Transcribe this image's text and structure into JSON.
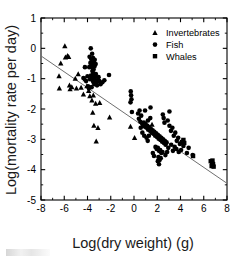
{
  "figure": {
    "background_color": "#ffffff",
    "ink_color": "#000000",
    "line_color": "#6f6f6f"
  },
  "chart_data": {
    "type": "scatter",
    "title": "",
    "xlabel": "Log(dry weight) (g)",
    "ylabel": "Log(mortality rate per day)",
    "xlim": [
      -8,
      8
    ],
    "ylim": [
      -5,
      1
    ],
    "xticks": [
      -8,
      -6,
      -4,
      -2,
      0,
      2,
      4,
      6,
      8
    ],
    "yticks": [
      1,
      0,
      -1,
      -2,
      -3,
      -4,
      -5
    ],
    "xtick_labels": [
      "-8",
      "-6",
      "-4",
      "-2",
      "0",
      "2",
      "4",
      "6",
      "8"
    ],
    "ytick_labels": [
      "1",
      "0",
      "-1",
      "-2",
      "-3",
      "-4",
      "-5"
    ],
    "xtick_minor_step": 1,
    "ytick_minor_step": 0.5,
    "grid": false,
    "tick_direction": "in",
    "frame": "box",
    "legend": {
      "position": "upper right",
      "entries": [
        {
          "label": "Invertebrates",
          "marker": "triangle"
        },
        {
          "label": "Fish",
          "marker": "circle"
        },
        {
          "label": "Whales",
          "marker": "square"
        }
      ]
    },
    "trendline": {
      "type": "linear-regression",
      "x_start": -8,
      "y_start": -0.25,
      "x_end": 8,
      "y_end": -4.45,
      "slope": -0.2625,
      "intercept": -2.35
    },
    "series": [
      {
        "name": "Invertebrates",
        "marker": "triangle",
        "points": [
          [
            -6.45,
            -0.92
          ],
          [
            -6.42,
            -1.32
          ],
          [
            -6.3,
            -0.5
          ],
          [
            -5.95,
            0.07
          ],
          [
            -5.9,
            -0.3
          ],
          [
            -5.72,
            -0.25
          ],
          [
            -5.62,
            -0.28
          ],
          [
            -5.55,
            -1.22
          ],
          [
            -5.5,
            -1.35
          ],
          [
            -5.35,
            -1.28
          ],
          [
            -5.05,
            -1.0
          ],
          [
            -4.95,
            -1.32
          ],
          [
            -4.8,
            -0.85
          ],
          [
            -4.55,
            -1.3
          ],
          [
            -4.35,
            -1.52
          ],
          [
            -4.2,
            -1.02
          ],
          [
            -4.05,
            -1.25
          ],
          [
            -3.9,
            -1.4
          ],
          [
            -3.8,
            -1.58
          ],
          [
            -3.62,
            -1.72
          ],
          [
            -3.55,
            -2.12
          ],
          [
            -3.5,
            -1.55
          ],
          [
            -3.45,
            -2.55
          ],
          [
            -3.3,
            -1.82
          ],
          [
            -3.25,
            -3.07
          ],
          [
            -3.1,
            -2.62
          ],
          [
            -2.95,
            -1.8
          ],
          [
            -2.1,
            -2.28
          ],
          [
            -0.3,
            -2.58
          ],
          [
            0.05,
            -2.95
          ],
          [
            1.55,
            -2.52
          ]
        ]
      },
      {
        "name": "Fish",
        "marker": "circle",
        "points": [
          [
            -3.72,
            0.0
          ],
          [
            -3.6,
            -0.18
          ],
          [
            -3.52,
            -0.32
          ],
          [
            -3.45,
            -0.45
          ],
          [
            -3.38,
            -0.38
          ],
          [
            -3.3,
            -0.52
          ],
          [
            -3.62,
            -0.55
          ],
          [
            -3.55,
            -0.62
          ],
          [
            -3.48,
            -0.7
          ],
          [
            -3.4,
            -0.6
          ],
          [
            -3.75,
            -0.48
          ],
          [
            -3.68,
            -0.35
          ],
          [
            -3.82,
            -0.28
          ],
          [
            -3.58,
            -0.75
          ],
          [
            -3.5,
            -0.82
          ],
          [
            -3.42,
            -0.88
          ],
          [
            -3.35,
            -0.95
          ],
          [
            -3.28,
            -0.85
          ],
          [
            -3.7,
            -0.9
          ],
          [
            -3.62,
            -0.98
          ],
          [
            -3.55,
            -1.05
          ],
          [
            -3.48,
            -1.12
          ],
          [
            -3.4,
            -1.18
          ],
          [
            -3.32,
            -1.08
          ],
          [
            -3.25,
            -1.15
          ],
          [
            -3.18,
            -1.22
          ],
          [
            -3.12,
            -1.05
          ],
          [
            -3.78,
            -1.02
          ],
          [
            -3.85,
            -0.62
          ],
          [
            -4.0,
            -0.92
          ],
          [
            -4.12,
            -1.08
          ],
          [
            -4.22,
            -0.62
          ],
          [
            -4.35,
            -0.98
          ],
          [
            -3.95,
            -1.25
          ],
          [
            -3.88,
            -1.32
          ],
          [
            -3.65,
            -1.28
          ],
          [
            -3.05,
            -0.95
          ],
          [
            -2.98,
            -1.08
          ],
          [
            -2.88,
            -1.18
          ],
          [
            -2.72,
            -1.12
          ],
          [
            -2.55,
            -1.05
          ],
          [
            -2.15,
            -0.88
          ],
          [
            -0.28,
            -1.42
          ],
          [
            -0.25,
            -1.55
          ],
          [
            -0.22,
            -1.68
          ],
          [
            -0.3,
            -1.78
          ],
          [
            -0.18,
            -2.1
          ],
          [
            0.35,
            -2.15
          ],
          [
            0.42,
            -2.32
          ],
          [
            0.55,
            -2.42
          ],
          [
            0.62,
            -2.22
          ],
          [
            0.7,
            -2.48
          ],
          [
            0.78,
            -2.55
          ],
          [
            0.85,
            -2.45
          ],
          [
            0.92,
            -2.58
          ],
          [
            1.0,
            -2.5
          ],
          [
            1.08,
            -2.62
          ],
          [
            1.15,
            -2.55
          ],
          [
            1.22,
            -2.68
          ],
          [
            1.3,
            -2.6
          ],
          [
            1.38,
            -2.72
          ],
          [
            1.45,
            -2.65
          ],
          [
            1.52,
            -2.78
          ],
          [
            1.6,
            -2.7
          ],
          [
            1.68,
            -2.82
          ],
          [
            1.75,
            -2.75
          ],
          [
            1.82,
            -2.88
          ],
          [
            1.9,
            -2.8
          ],
          [
            1.98,
            -2.92
          ],
          [
            2.05,
            -2.85
          ],
          [
            2.12,
            -2.98
          ],
          [
            2.2,
            -2.9
          ],
          [
            2.28,
            -3.02
          ],
          [
            2.35,
            -2.95
          ],
          [
            2.42,
            -3.08
          ],
          [
            2.5,
            -3.0
          ],
          [
            2.58,
            -3.12
          ],
          [
            2.65,
            -3.05
          ],
          [
            2.72,
            -3.18
          ],
          [
            2.8,
            -3.1
          ],
          [
            1.85,
            -3.25
          ],
          [
            1.95,
            -3.32
          ],
          [
            2.05,
            -3.28
          ],
          [
            2.15,
            -3.38
          ],
          [
            2.25,
            -3.35
          ],
          [
            2.35,
            -3.45
          ],
          [
            2.45,
            -3.42
          ],
          [
            2.1,
            -3.58
          ],
          [
            2.2,
            -3.68
          ],
          [
            2.3,
            -3.62
          ],
          [
            2.05,
            -3.72
          ],
          [
            2.15,
            -3.82
          ],
          [
            1.72,
            -3.55
          ],
          [
            1.62,
            -3.45
          ],
          [
            0.48,
            -2.05
          ],
          [
            0.95,
            -2.05
          ],
          [
            1.2,
            -2.38
          ],
          [
            1.4,
            -2.3
          ],
          [
            2.55,
            -2.3
          ],
          [
            2.62,
            -2.45
          ],
          [
            2.9,
            -2.38
          ],
          [
            3.05,
            -2.55
          ],
          [
            3.18,
            -2.72
          ],
          [
            3.3,
            -2.62
          ],
          [
            3.42,
            -2.88
          ],
          [
            3.55,
            -2.78
          ],
          [
            3.68,
            -3.05
          ],
          [
            3.8,
            -2.95
          ],
          [
            3.95,
            -3.15
          ],
          [
            4.1,
            -3.08
          ],
          [
            4.25,
            -3.22
          ],
          [
            4.05,
            -3.35
          ],
          [
            3.85,
            -3.42
          ],
          [
            3.65,
            -3.32
          ],
          [
            3.5,
            -3.25
          ],
          [
            3.35,
            -3.38
          ],
          [
            3.2,
            -3.18
          ],
          [
            2.95,
            -3.28
          ],
          [
            2.85,
            -3.42
          ],
          [
            2.7,
            -3.52
          ],
          [
            1.08,
            -2.95
          ],
          [
            1.18,
            -3.05
          ],
          [
            1.28,
            -2.88
          ],
          [
            0.88,
            -2.88
          ],
          [
            0.72,
            -2.78
          ],
          [
            2.48,
            -2.18
          ],
          [
            3.05,
            -2.08
          ],
          [
            1.42,
            -1.95
          ],
          [
            0.58,
            -2.62
          ],
          [
            4.55,
            -3.45
          ],
          [
            4.7,
            -3.28
          ],
          [
            5.05,
            -3.52
          ]
        ]
      },
      {
        "name": "Whales",
        "marker": "square",
        "points": [
          [
            6.6,
            -3.72
          ],
          [
            6.72,
            -3.78
          ],
          [
            6.68,
            -3.88
          ],
          [
            6.8,
            -3.82
          ],
          [
            6.75,
            -3.7
          ],
          [
            6.85,
            -3.9
          ],
          [
            5.08,
            -3.55
          ],
          [
            4.25,
            -3.02
          ],
          [
            4.32,
            -3.12
          ]
        ]
      }
    ]
  }
}
